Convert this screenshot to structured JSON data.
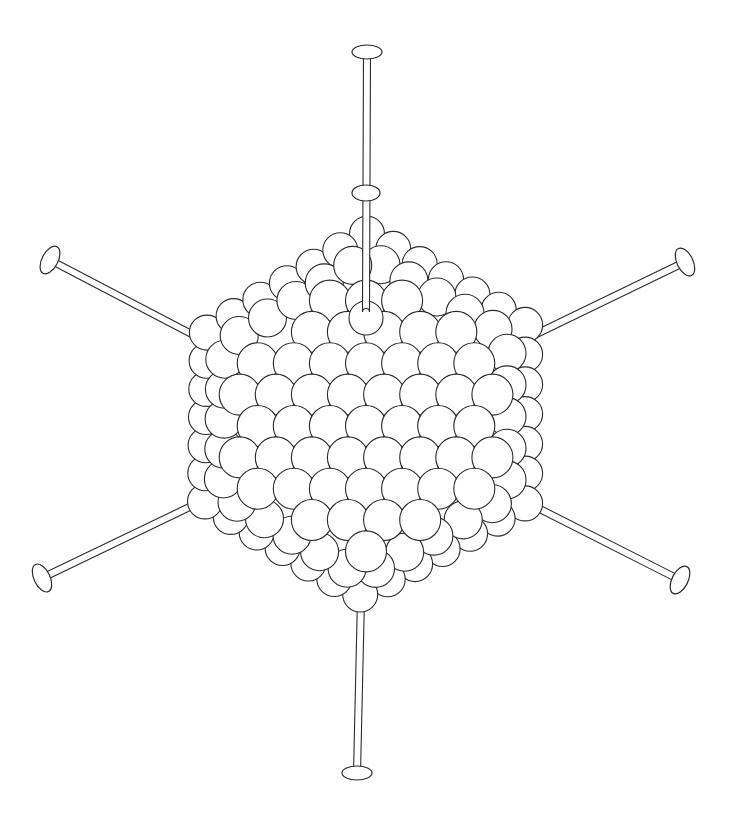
{
  "illustration": {
    "subject": "icosahedral virus particle with projecting fibers",
    "colors": {
      "background": "#ffffff",
      "stroke": "#2a2a2a",
      "fill": "#ffffff"
    },
    "body": {
      "center": [
        366,
        418
      ],
      "vertices": [
        [
          367,
          228
        ],
        [
          530,
          322
        ],
        [
          530,
          506
        ],
        [
          360,
          600
        ],
        [
          200,
          504
        ],
        [
          202,
          330
        ]
      ],
      "capsomer_radius": 19,
      "layers": [
        {
          "depth": 0,
          "offset": [
            0,
            0
          ],
          "scale": 1.0
        },
        {
          "depth": 1,
          "offset": [
            -12,
            8
          ],
          "scale": 0.96
        },
        {
          "depth": 1,
          "offset": [
            12,
            8
          ],
          "scale": 0.96
        }
      ]
    },
    "fibers": [
      {
        "name": "top",
        "base": [
          366,
          312
        ],
        "tip": [
          367,
          52
        ],
        "knob_rx": 15,
        "knob_ry": 7,
        "mid_knob": [
          366,
          193
        ]
      },
      {
        "name": "upper-left",
        "base": [
          203,
          340
        ],
        "tip": [
          50,
          260
        ],
        "knob_rx": 8,
        "knob_ry": 15
      },
      {
        "name": "upper-right",
        "base": [
          528,
          338
        ],
        "tip": [
          685,
          262
        ],
        "knob_rx": 8,
        "knob_ry": 15
      },
      {
        "name": "lower-left",
        "base": [
          200,
          502
        ],
        "tip": [
          42,
          578
        ],
        "knob_rx": 8,
        "knob_ry": 15
      },
      {
        "name": "lower-right",
        "base": [
          528,
          503
        ],
        "tip": [
          680,
          580
        ],
        "knob_rx": 8,
        "knob_ry": 15
      },
      {
        "name": "bottom",
        "base": [
          361,
          598
        ],
        "tip": [
          357,
          773
        ],
        "knob_rx": 15,
        "knob_ry": 7
      }
    ],
    "rod_width": 7
  }
}
